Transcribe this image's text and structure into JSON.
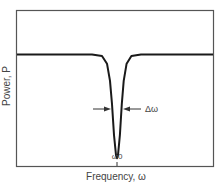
{
  "chart_data": {
    "type": "line",
    "title": "",
    "xlabel": "Frequency, ω",
    "ylabel": "Power, P",
    "grid": false,
    "legend": "none",
    "x_tick_labels": [
      {
        "x": 0,
        "label": "ω0"
      }
    ],
    "xlim": [
      -1,
      1
    ],
    "ylim": [
      0,
      1
    ],
    "baseline_power": 0.72,
    "dip_minimum_power": 0.05,
    "dip_center": 0,
    "dip_width_label": "Δω",
    "series": [
      {
        "name": "Transmitted power",
        "shape": "lorentzian-like dip",
        "points": [
          {
            "x": -1.0,
            "y": 0.72
          },
          {
            "x": -0.25,
            "y": 0.72
          },
          {
            "x": -0.15,
            "y": 0.71
          },
          {
            "x": -0.1,
            "y": 0.66
          },
          {
            "x": -0.07,
            "y": 0.55
          },
          {
            "x": -0.05,
            "y": 0.4
          },
          {
            "x": -0.03,
            "y": 0.2
          },
          {
            "x": -0.01,
            "y": 0.07
          },
          {
            "x": 0.0,
            "y": 0.05
          },
          {
            "x": 0.01,
            "y": 0.07
          },
          {
            "x": 0.03,
            "y": 0.2
          },
          {
            "x": 0.05,
            "y": 0.4
          },
          {
            "x": 0.07,
            "y": 0.55
          },
          {
            "x": 0.1,
            "y": 0.66
          },
          {
            "x": 0.15,
            "y": 0.71
          },
          {
            "x": 0.25,
            "y": 0.72
          },
          {
            "x": 1.0,
            "y": 0.72
          }
        ]
      }
    ]
  }
}
